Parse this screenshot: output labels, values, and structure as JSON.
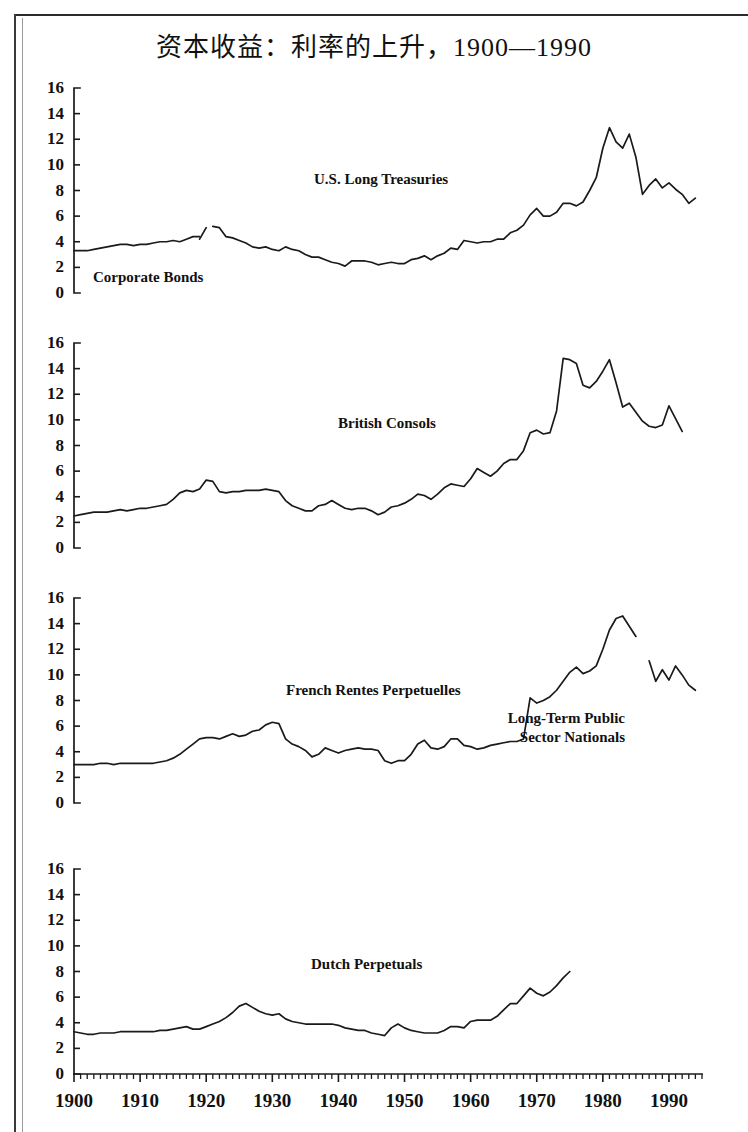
{
  "figure": {
    "title": "资本收益：利率的上升，1900—1990",
    "y_ticks": [
      0,
      2,
      4,
      6,
      8,
      10,
      12,
      14,
      16
    ],
    "x_ticks": [
      1900,
      1910,
      1920,
      1930,
      1940,
      1950,
      1960,
      1970,
      1980,
      1990
    ],
    "x_tick_labels": [
      "1900",
      "1910",
      "1920",
      "1930",
      "1940",
      "1950",
      "1960",
      "1970",
      "1980",
      "1990"
    ],
    "y_tick_labels": [
      "0",
      "2",
      "4",
      "6",
      "8",
      "10",
      "12",
      "14",
      "16"
    ],
    "ink_color": "#1a1a1a"
  },
  "chart_data": {
    "type": "line",
    "title": "资本收益：利率的上升，1900—1990",
    "xlabel": "",
    "ylabel": "",
    "xlim": [
      1900,
      1995
    ],
    "ylim": [
      0,
      16
    ],
    "grid": false,
    "legend": "inline-annotations",
    "panels": [
      {
        "index": 1,
        "labels": [
          "U.S. Long Treasuries",
          "Corporate Bonds"
        ],
        "series": [
          {
            "name": "Corporate Bonds",
            "x": [
              1900,
              1901,
              1902,
              1903,
              1904,
              1905,
              1906,
              1907,
              1908,
              1909,
              1910,
              1911,
              1912,
              1913,
              1914,
              1915,
              1916,
              1917,
              1918,
              1919
            ],
            "values": [
              3.3,
              3.3,
              3.3,
              3.4,
              3.5,
              3.6,
              3.7,
              3.8,
              3.8,
              3.7,
              3.8,
              3.8,
              3.9,
              4.0,
              4.0,
              4.1,
              4.0,
              4.2,
              4.4,
              4.4
            ]
          },
          {
            "name": "Corporate Bonds (post-1919 spike)",
            "x": [
              1919,
              1920
            ],
            "values": [
              4.2,
              5.1
            ]
          },
          {
            "name": "U.S. Long Treasuries",
            "x": [
              1921,
              1922,
              1923,
              1924,
              1925,
              1926,
              1927,
              1928,
              1929,
              1930,
              1931,
              1932,
              1933,
              1934,
              1935,
              1936,
              1937,
              1938,
              1939,
              1940,
              1941,
              1942,
              1943,
              1944,
              1945,
              1946,
              1947,
              1948,
              1949,
              1950,
              1951,
              1952,
              1953,
              1954,
              1955,
              1956,
              1957,
              1958,
              1959,
              1960,
              1961,
              1962,
              1963,
              1964,
              1965,
              1966,
              1967,
              1968,
              1969,
              1970,
              1971,
              1972,
              1973,
              1974,
              1975,
              1976,
              1977,
              1978,
              1979,
              1980,
              1981,
              1982,
              1983,
              1984,
              1985,
              1986,
              1987,
              1988,
              1989,
              1990,
              1991,
              1992,
              1993,
              1994
            ],
            "values": [
              5.2,
              5.1,
              4.4,
              4.3,
              4.1,
              3.9,
              3.6,
              3.5,
              3.6,
              3.4,
              3.3,
              3.6,
              3.4,
              3.3,
              3.0,
              2.8,
              2.8,
              2.6,
              2.4,
              2.3,
              2.1,
              2.5,
              2.5,
              2.5,
              2.4,
              2.2,
              2.3,
              2.4,
              2.3,
              2.3,
              2.6,
              2.7,
              2.9,
              2.6,
              2.9,
              3.1,
              3.5,
              3.4,
              4.1,
              4.0,
              3.9,
              4.0,
              4.0,
              4.2,
              4.2,
              4.7,
              4.9,
              5.3,
              6.1,
              6.6,
              6.0,
              6.0,
              6.3,
              7.0,
              7.0,
              6.8,
              7.1,
              8.0,
              9.0,
              11.3,
              12.9,
              11.8,
              11.3,
              12.4,
              10.6,
              7.7,
              8.4,
              8.9,
              8.2,
              8.6,
              8.1,
              7.7,
              7.0,
              7.4
            ]
          }
        ]
      },
      {
        "index": 2,
        "labels": [
          "British Consols"
        ],
        "series": [
          {
            "name": "British Consols",
            "x": [
              1900,
              1901,
              1902,
              1903,
              1904,
              1905,
              1906,
              1907,
              1908,
              1909,
              1910,
              1911,
              1912,
              1913,
              1914,
              1915,
              1916,
              1917,
              1918,
              1919,
              1920,
              1921,
              1922,
              1923,
              1924,
              1925,
              1926,
              1927,
              1928,
              1929,
              1930,
              1931,
              1932,
              1933,
              1934,
              1935,
              1936,
              1937,
              1938,
              1939,
              1940,
              1941,
              1942,
              1943,
              1944,
              1945,
              1946,
              1947,
              1948,
              1949,
              1950,
              1951,
              1952,
              1953,
              1954,
              1955,
              1956,
              1957,
              1958,
              1959,
              1960,
              1961,
              1962,
              1963,
              1964,
              1965,
              1966,
              1967,
              1968,
              1969,
              1970,
              1971,
              1972,
              1973,
              1974,
              1975,
              1976,
              1977,
              1978,
              1979,
              1980,
              1981,
              1982,
              1983,
              1984,
              1985,
              1986,
              1987,
              1988,
              1989,
              1990,
              1991,
              1992,
              1993,
              1994
            ],
            "values": [
              2.5,
              2.6,
              2.7,
              2.8,
              2.8,
              2.8,
              2.9,
              3.0,
              2.9,
              3.0,
              3.1,
              3.1,
              3.2,
              3.3,
              3.4,
              3.8,
              4.3,
              4.5,
              4.4,
              4.6,
              5.3,
              5.2,
              4.4,
              4.3,
              4.4,
              4.4,
              4.5,
              4.5,
              4.5,
              4.6,
              4.5,
              4.4,
              3.7,
              3.3,
              3.1,
              2.9,
              2.9,
              3.3,
              3.4,
              3.7,
              3.4,
              3.1,
              3.0,
              3.1,
              3.1,
              2.9,
              2.6,
              2.8,
              3.2,
              3.3,
              3.5,
              3.8,
              4.2,
              4.1,
              3.8,
              4.2,
              4.7,
              5.0,
              4.9,
              4.8,
              5.4,
              6.2,
              5.9,
              5.6,
              6.0,
              6.6,
              6.9,
              6.9,
              7.6,
              9.0,
              9.2,
              8.9,
              9.0,
              10.7,
              14.8,
              14.7,
              14.4,
              12.7,
              12.5,
              13.0,
              13.8,
              14.7,
              12.9,
              11.0,
              11.3,
              10.6,
              9.9,
              9.5,
              9.4,
              9.6,
              11.1,
              10.1,
              9.1
            ]
          }
        ]
      },
      {
        "index": 3,
        "labels": [
          "French Rentes Perpetuelles",
          "Long-Term Public Sector Nationals"
        ],
        "series": [
          {
            "name": "French Rentes Perpetuelles",
            "x": [
              1900,
              1901,
              1902,
              1903,
              1904,
              1905,
              1906,
              1907,
              1908,
              1909,
              1910,
              1911,
              1912,
              1913,
              1914,
              1915,
              1916,
              1917,
              1918,
              1919,
              1920,
              1921,
              1922,
              1923,
              1924,
              1925,
              1926,
              1927,
              1928,
              1929,
              1930,
              1931,
              1932,
              1933,
              1934,
              1935,
              1936,
              1937,
              1938,
              1939,
              1940,
              1941,
              1942,
              1943,
              1944,
              1945,
              1946,
              1947,
              1948,
              1949,
              1950,
              1951,
              1952,
              1953,
              1954,
              1955,
              1956,
              1957,
              1958,
              1959,
              1960,
              1961,
              1962,
              1963,
              1964,
              1965,
              1966,
              1967,
              1968,
              1969,
              1970,
              1971,
              1972,
              1973,
              1974,
              1975,
              1976,
              1977,
              1978,
              1979,
              1980,
              1981,
              1982,
              1983,
              1984,
              1985
            ],
            "values": [
              3.0,
              3.0,
              3.0,
              3.0,
              3.1,
              3.1,
              3.0,
              3.1,
              3.1,
              3.1,
              3.1,
              3.1,
              3.1,
              3.2,
              3.3,
              3.5,
              3.8,
              4.2,
              4.6,
              5.0,
              5.1,
              5.1,
              5.0,
              5.2,
              5.4,
              5.2,
              5.3,
              5.6,
              5.7,
              6.1,
              6.3,
              6.2,
              5.0,
              4.6,
              4.4,
              4.1,
              3.6,
              3.8,
              4.3,
              4.1,
              3.9,
              4.1,
              4.2,
              4.3,
              4.2,
              4.2,
              4.1,
              3.3,
              3.1,
              3.3,
              3.3,
              3.8,
              4.6,
              4.9,
              4.3,
              4.2,
              4.4,
              5.0,
              5.0,
              4.5,
              4.4,
              4.2,
              4.3,
              4.5,
              4.6,
              4.7,
              4.8,
              4.8,
              5.0,
              8.2,
              7.8,
              8.0,
              8.3,
              8.8,
              9.5,
              10.2,
              10.6,
              10.1,
              10.3,
              10.7,
              12.0,
              13.5,
              14.4,
              14.6,
              13.8,
              13.0
            ]
          },
          {
            "name": "Long-Term Public Sector Nationals",
            "x": [
              1987,
              1988,
              1989,
              1990,
              1991,
              1992,
              1993,
              1994
            ],
            "values": [
              11.1,
              9.5,
              10.4,
              9.6,
              10.7,
              10.0,
              9.2,
              8.8
            ]
          }
        ]
      },
      {
        "index": 4,
        "labels": [
          "Dutch Perpetuals"
        ],
        "series": [
          {
            "name": "Dutch Perpetuals",
            "x": [
              1900,
              1901,
              1902,
              1903,
              1904,
              1905,
              1906,
              1907,
              1908,
              1909,
              1910,
              1911,
              1912,
              1913,
              1914,
              1915,
              1916,
              1917,
              1918,
              1919,
              1920,
              1921,
              1922,
              1923,
              1924,
              1925,
              1926,
              1927,
              1928,
              1929,
              1930,
              1931,
              1932,
              1933,
              1934,
              1935,
              1936,
              1937,
              1938,
              1939,
              1940,
              1941,
              1942,
              1943,
              1944,
              1945,
              1946,
              1947,
              1948,
              1949,
              1950,
              1951,
              1952,
              1953,
              1954,
              1955,
              1956,
              1957,
              1958,
              1959,
              1960,
              1961,
              1962,
              1963,
              1964,
              1965,
              1966,
              1967,
              1968,
              1969,
              1970,
              1971,
              1972,
              1973,
              1974,
              1975
            ],
            "values": [
              3.3,
              3.2,
              3.1,
              3.1,
              3.2,
              3.2,
              3.2,
              3.3,
              3.3,
              3.3,
              3.3,
              3.3,
              3.3,
              3.4,
              3.4,
              3.5,
              3.6,
              3.7,
              3.5,
              3.5,
              3.7,
              3.9,
              4.1,
              4.4,
              4.8,
              5.3,
              5.5,
              5.2,
              4.9,
              4.7,
              4.6,
              4.7,
              4.3,
              4.1,
              4.0,
              3.9,
              3.9,
              3.9,
              3.9,
              3.9,
              3.8,
              3.6,
              3.5,
              3.4,
              3.4,
              3.2,
              3.1,
              3.0,
              3.6,
              3.9,
              3.6,
              3.4,
              3.3,
              3.2,
              3.2,
              3.2,
              3.4,
              3.7,
              3.7,
              3.6,
              4.1,
              4.2,
              4.2,
              4.2,
              4.5,
              5.0,
              5.5,
              5.5,
              6.1,
              6.7,
              6.3,
              6.1,
              6.4,
              6.9,
              7.5,
              8.0
            ]
          }
        ]
      }
    ]
  }
}
